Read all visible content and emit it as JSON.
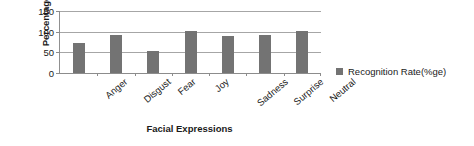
{
  "chart_data": {
    "type": "bar",
    "title": "",
    "categories": [
      "Anger",
      "Disgust",
      "Fear",
      "Joy",
      "Sadness",
      "Surprise",
      "Neutral"
    ],
    "values": [
      72,
      91,
      53,
      101,
      89,
      91,
      101
    ],
    "series": [
      {
        "name": "Recognition Rate(%ge)",
        "values": [
          72,
          91,
          53,
          101,
          89,
          91,
          101
        ]
      }
    ],
    "xlabel": "Facial Expressions",
    "ylabel": "Percentage",
    "ylim": [
      0,
      150
    ],
    "yticks": [
      0,
      50,
      100,
      150
    ],
    "ytick_labels": [
      "0",
      "50",
      "100",
      "150"
    ],
    "grid": true,
    "legend_position": "right",
    "bar_color": "#737373",
    "gridline_color": "#a6a6a6",
    "axis_color": "#8c8c8c",
    "text_color": "#1a1a1a"
  },
  "legend": {
    "entries": [
      {
        "label": "Recognition Rate(%ge)",
        "color": "#737373"
      }
    ]
  }
}
